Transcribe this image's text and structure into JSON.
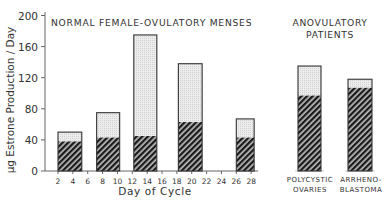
{
  "chart_data": {
    "type": "bar",
    "stacked": true,
    "title": "",
    "ylabel": "μg Estrone Production / Day",
    "xlabel": "Day of Cycle",
    "ylim": [
      0,
      200
    ],
    "yticks": [
      0,
      40,
      80,
      120,
      160,
      200
    ],
    "xticks": [
      2,
      4,
      6,
      8,
      10,
      12,
      14,
      16,
      18,
      20,
      22,
      24,
      26,
      28
    ],
    "grid": false,
    "legend": null,
    "groups": [
      {
        "label": "NORMAL FEMALE-OVULATORY MENSES",
        "categories": [
          "Days 2-5",
          "Days 7-10",
          "Days 12-15",
          "Days 18-21",
          "Days 26-28"
        ],
        "bars": [
          {
            "x_start": 2.0,
            "x_end": 5.2,
            "hatched": 38,
            "total": 50
          },
          {
            "x_start": 7.2,
            "x_end": 10.3,
            "hatched": 43,
            "total": 75
          },
          {
            "x_start": 12.2,
            "x_end": 15.3,
            "hatched": 45,
            "total": 175
          },
          {
            "x_start": 18.2,
            "x_end": 21.4,
            "hatched": 63,
            "total": 138
          },
          {
            "x_start": 26.0,
            "x_end": 28.4,
            "hatched": 43,
            "total": 67
          }
        ]
      },
      {
        "label": "ANOVULATORY PATIENTS",
        "categories": [
          "POLYCYSTIC OVARIES",
          "ARRHENO-BLASTOMA"
        ],
        "bars": [
          {
            "hatched": 97,
            "total": 135
          },
          {
            "hatched": 107,
            "total": 118
          }
        ]
      }
    ],
    "series": [
      {
        "name": "hatched (lower segment)",
        "values": [
          38,
          43,
          45,
          63,
          43,
          97,
          107
        ]
      },
      {
        "name": "stippled (upper segment)",
        "values": [
          12,
          32,
          130,
          75,
          24,
          38,
          11
        ]
      }
    ],
    "categories": [
      "2-4",
      "8-10",
      "12-14",
      "18-20",
      "26-28",
      "Polycystic Ovaries",
      "Arrhenoblastoma"
    ]
  },
  "labels": {
    "group_normal": "NORMAL FEMALE-OVULATORY MENSES",
    "group_anov_line1": "ANOVULATORY",
    "group_anov_line2": "PATIENTS",
    "ylabel": "μg Estrone Production / Day",
    "xlabel": "Day of Cycle",
    "cat_poly_line1": "POLYCYSTIC",
    "cat_poly_line2": "OVARIES",
    "cat_arr_line1": "ARRHENO-",
    "cat_arr_line2": "BLASTOMA"
  },
  "colors": {
    "hatch_fg": "#1a1a1a",
    "hatch_bg": "#bdbdbd",
    "stipple": "#e4e4e4",
    "axis": "#555555",
    "outline": "#333333"
  }
}
